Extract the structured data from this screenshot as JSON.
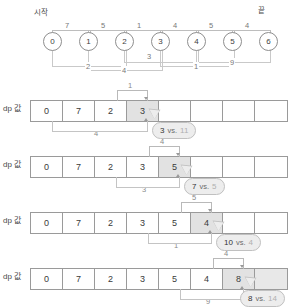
{
  "graph": {
    "start_label": "시작",
    "end_label": "끝",
    "nodes": [
      "0",
      "1",
      "2",
      "3",
      "4",
      "5",
      "6"
    ],
    "top_edges": [
      {
        "from": "0",
        "to": "1",
        "weight": "7"
      },
      {
        "from": "1",
        "to": "2",
        "weight": "5"
      },
      {
        "from": "2",
        "to": "3",
        "weight": "1"
      },
      {
        "from": "3",
        "to": "4",
        "weight": "4"
      },
      {
        "from": "4",
        "to": "5",
        "weight": "5"
      },
      {
        "from": "5",
        "to": "6",
        "weight": "4"
      }
    ],
    "bottom_edges": [
      {
        "from": "0",
        "to": "2",
        "weight": "2"
      },
      {
        "from": "1",
        "to": "3",
        "weight": "4"
      },
      {
        "from": "2",
        "to": "4",
        "weight": "3"
      },
      {
        "from": "3",
        "to": "5",
        "weight": "1"
      },
      {
        "from": "4",
        "to": "6",
        "weight": "9"
      }
    ]
  },
  "rows": [
    {
      "label": "dp 값",
      "cells": [
        "0",
        "7",
        "2",
        "3",
        "",
        "",
        "",
        ""
      ],
      "upper_bracket_label": "1",
      "lower_bracket_label": "4",
      "bubble": {
        "a": "3",
        "vs": "vs.",
        "b": "11"
      }
    },
    {
      "label": "dp 값",
      "cells": [
        "0",
        "7",
        "2",
        "3",
        "5",
        "",
        "",
        ""
      ],
      "upper_bracket_label": "4",
      "lower_bracket_label": "3",
      "bubble": {
        "a": "7",
        "vs": "vs.",
        "b": "5"
      }
    },
    {
      "label": "dp 값",
      "cells": [
        "0",
        "7",
        "2",
        "3",
        "5",
        "4",
        "",
        ""
      ],
      "upper_bracket_label": "5",
      "lower_bracket_label": "1",
      "bubble": {
        "a": "10",
        "vs": "vs.",
        "b": "4"
      }
    },
    {
      "label": "dp 값",
      "cells": [
        "0",
        "7",
        "2",
        "3",
        "5",
        "4",
        "8",
        ""
      ],
      "upper_bracket_label": "4",
      "lower_bracket_label": "9",
      "bubble": {
        "a": "8",
        "vs": "vs.",
        "b": "14"
      }
    }
  ]
}
